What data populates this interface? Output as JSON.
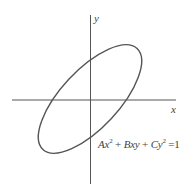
{
  "figure": {
    "axes": {
      "x_label": "x",
      "y_label": "y"
    },
    "equation": {
      "term_a": "Ax",
      "exp_a": "2",
      "plus1": " + ",
      "term_b": "Bxy",
      "plus2": " + ",
      "term_c": "Cy",
      "exp_c": "2",
      "equals": " =1",
      "full_text": "Ax^2 + Bxy + Cy^2 =1"
    },
    "colors": {
      "stroke": "#555555",
      "background": "#ffffff"
    },
    "shape": {
      "type": "rotated ellipse",
      "center": [
        90,
        99
      ],
      "rotation_deg": -47,
      "semi_major": 69,
      "semi_minor": 29
    }
  }
}
